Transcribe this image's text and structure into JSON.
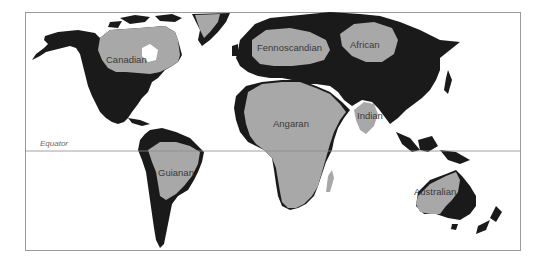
{
  "map": {
    "type": "world map of continental shields",
    "reference_line": {
      "label": "Equator"
    },
    "colors": {
      "land": "#1a1a1a",
      "shield": "#a8a8a8",
      "water": "#ffffff",
      "frame": "#9a9a9a"
    },
    "regions": [
      {
        "id": "canadian",
        "label": "Canadian"
      },
      {
        "id": "fennoscandian",
        "label": "Fennoscandian"
      },
      {
        "id": "angaran",
        "label": "Angaran"
      },
      {
        "id": "african",
        "label": "African"
      },
      {
        "id": "indian",
        "label": "Indian"
      },
      {
        "id": "guianan",
        "label": "Guianan"
      },
      {
        "id": "australian",
        "label": "Australian"
      }
    ]
  }
}
